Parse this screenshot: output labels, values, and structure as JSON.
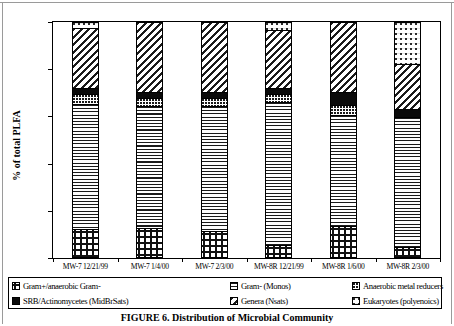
{
  "chart_data": {
    "type": "bar",
    "subtype": "stacked-percent",
    "title": "",
    "xlabel": "",
    "ylabel": "% of total PLFA",
    "ylim": [
      0,
      100
    ],
    "ytick_labels": [
      "0%",
      "20%",
      "40%",
      "60%",
      "80%",
      "100%"
    ],
    "ytick_values": [
      0,
      20,
      40,
      60,
      80,
      100
    ],
    "grid": false,
    "legend_position": "bottom",
    "categories": [
      "MW-7 12/21/99",
      "MW-7 1/4/00",
      "MW-7 2/3/00",
      "MW-8R 12/21/99",
      "MW-8R 1/6/00",
      "MW-8R 2/3/00"
    ],
    "series": [
      {
        "name": "Gram+/anaerobic Gram-",
        "pattern": "checkerboard",
        "values": [
          12,
          12,
          11,
          5,
          13,
          4
        ]
      },
      {
        "name": "Gram- (Monos)",
        "pattern": "horizontal-lines",
        "values": [
          54,
          53,
          54,
          62,
          48,
          56
        ]
      },
      {
        "name": "Anaerobic metal reducers",
        "pattern": "fine-dots",
        "values": [
          4,
          3,
          3,
          3,
          4,
          0
        ]
      },
      {
        "name": "SRB/Actinomycetes (MidBrSats)",
        "pattern": "solid-black",
        "values": [
          2,
          2,
          2,
          2,
          5,
          3
        ]
      },
      {
        "name": "Genera (Nsats)",
        "pattern": "diagonal-hatch",
        "values": [
          26,
          30,
          30,
          25,
          30,
          19
        ]
      },
      {
        "name": "Eukaryotes (polyenoics)",
        "pattern": "sparse-dots",
        "values": [
          2,
          0,
          0,
          3,
          0,
          18
        ]
      }
    ]
  },
  "axis": {
    "y_title": "% of total PLFA"
  },
  "legend": {
    "items": [
      {
        "label": "Gram+/anaerobic Gram-",
        "swatch": "checkerboard-swatch"
      },
      {
        "label": "Gram- (Monos)",
        "swatch": "horizontal-lines-swatch"
      },
      {
        "label": "Anaerobic metal reducers",
        "swatch": "fine-dots-swatch"
      },
      {
        "label": "SRB/Actinomycetes (MidBrSats)",
        "swatch": "solid-black-swatch"
      },
      {
        "label": "Genera (Nsats)",
        "swatch": "diagonal-hatch-swatch"
      },
      {
        "label": "Eukaryotes (polyenoics)",
        "swatch": "sparse-dots-swatch"
      }
    ]
  },
  "caption": {
    "text": "FIGURE 6.  Distribution of Microbial Community"
  }
}
